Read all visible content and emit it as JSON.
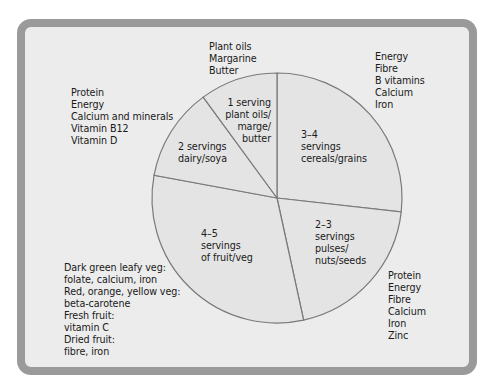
{
  "chart_data": {
    "type": "pie",
    "title": "",
    "center": [
      277,
      198
    ],
    "radius": 125,
    "slices": [
      {
        "name": "cereals/grains",
        "label": [
          "3–4",
          "servings",
          "cereals/grains"
        ],
        "start_deg": 0,
        "end_deg": 96.4,
        "percent": 26.8,
        "nutrients": [
          "Energy",
          "Fibre",
          "B vitamins",
          "Calcium",
          "Iron"
        ]
      },
      {
        "name": "pulses/nuts/seeds",
        "label": [
          "2–3",
          "servings",
          "pulses/",
          "nuts/seeds"
        ],
        "start_deg": 96.4,
        "end_deg": 167.7,
        "percent": 19.8,
        "nutrients": [
          "Protein",
          "Energy",
          "Fibre",
          "Calcium",
          "Iron",
          "Zinc"
        ]
      },
      {
        "name": "fruit/veg",
        "label": [
          "4–5",
          "servings",
          "of fruit/veg"
        ],
        "start_deg": 167.7,
        "end_deg": 280.5,
        "percent": 31.3,
        "nutrients": [
          "Dark green leafy veg:",
          "folate, calcium, iron",
          "Red, orange, yellow veg:",
          "beta-carotene",
          "Fresh fruit:",
          "vitamin C",
          "Dried fruit:",
          "fibre, iron"
        ]
      },
      {
        "name": "dairy/soya",
        "label": [
          "2 servings",
          "dairy/soya"
        ],
        "start_deg": 280.5,
        "end_deg": 323.8,
        "percent": 12.0,
        "nutrients": [
          "Protein",
          "Energy",
          "Calcium and minerals",
          "Vitamin B12",
          "Vitamin D"
        ]
      },
      {
        "name": "plant oils/marge/butter",
        "label": [
          "1 serving",
          "plant oils/",
          "marge/",
          "butter"
        ],
        "start_deg": 323.8,
        "end_deg": 360,
        "percent": 10.1,
        "nutrients": [
          "Plant oils",
          "Margarine",
          "Butter"
        ]
      }
    ],
    "colors": {
      "pie_fill": "#e4e4e4",
      "pie_stroke": "#7a7a7a",
      "panel_bg": "#ececec",
      "panel_border": "#9a9a9a"
    }
  },
  "labels": {
    "oils_header": [
      "Plant oils",
      "Margarine",
      "Butter"
    ],
    "dairy_notes": [
      "Protein",
      "Energy",
      "Calcium and minerals",
      "Vitamin B12",
      "Vitamin D"
    ],
    "cereal_notes": [
      "Energy",
      "Fibre",
      "B vitamins",
      "Calcium",
      "Iron"
    ],
    "pulses_notes": [
      "Protein",
      "Energy",
      "Fibre",
      "Calcium",
      "Iron",
      "Zinc"
    ],
    "fruitveg_notes": [
      "Dark green leafy veg:",
      "folate, calcium, iron",
      "Red, orange, yellow veg:",
      "beta-carotene",
      "Fresh fruit:",
      "vitamin C",
      "Dried fruit:",
      "fibre, iron"
    ],
    "slice_oils": [
      "1 serving",
      "plant oils/",
      "marge/",
      "butter"
    ],
    "slice_dairy": [
      "2 servings",
      "dairy/soya"
    ],
    "slice_cereals": [
      "3–4",
      "servings",
      "cereals/grains"
    ],
    "slice_fruitveg": [
      "4–5",
      "servings",
      "of fruit/veg"
    ],
    "slice_pulses": [
      "2–3",
      "servings",
      "pulses/",
      "nuts/seeds"
    ]
  }
}
